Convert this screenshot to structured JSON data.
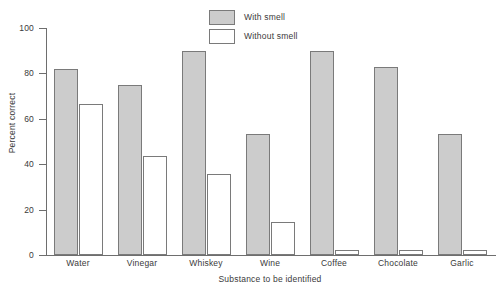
{
  "chart_data": {
    "type": "bar",
    "title": "",
    "subtitle": "",
    "xlabel": "Substance to be identified",
    "ylabel": "Percent correct",
    "categories": [
      "Water",
      "Vinegar",
      "Whiskey",
      "Wine",
      "Coffee",
      "Chocolate",
      "Garlic"
    ],
    "series": [
      {
        "name": "With smell",
        "values": [
          82,
          75,
          90,
          53.5,
          90,
          83,
          53.5
        ],
        "color": "#cccccc"
      },
      {
        "name": "Without smell",
        "values": [
          66.5,
          43.5,
          35.5,
          14.5,
          2,
          2,
          2
        ],
        "color": "#ffffff"
      }
    ],
    "ylim": [
      0,
      100
    ],
    "yticks": [
      0,
      20,
      40,
      60,
      80,
      100
    ],
    "ytick_labels": [
      "0",
      "20",
      "40",
      "60",
      "80",
      "100"
    ],
    "grid": false,
    "legend_position": "top-center"
  },
  "legend": {
    "items": [
      {
        "label": "With smell"
      },
      {
        "label": "Without smell"
      }
    ]
  },
  "axes": {
    "y_title": "Percent correct",
    "x_title": "Substance to be identified"
  }
}
